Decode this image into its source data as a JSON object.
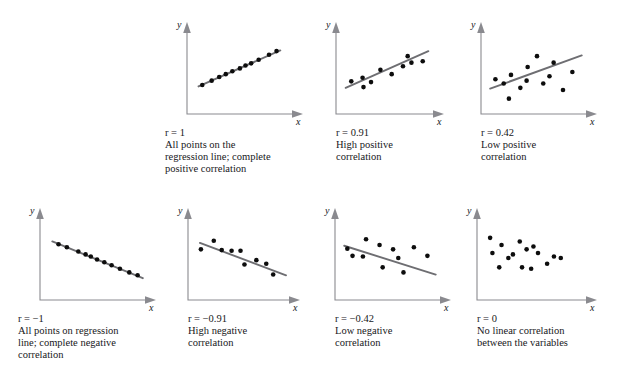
{
  "figure": {
    "axis_label_x": "x",
    "axis_label_y": "y",
    "line_color": "#6e6e72",
    "axis_color": "#8a8a8f",
    "point_color": "#0d0d0d",
    "background": "#ffffff"
  },
  "chart_data": {
    "type": "scatter",
    "xlabel": "x",
    "ylabel": "y",
    "grid": false,
    "legend": "none",
    "axis_ranges": {
      "xlim": [
        0,
        100
      ],
      "ylim": [
        0,
        100
      ]
    },
    "panels": [
      {
        "id": "r-1",
        "row": 1,
        "col": 1,
        "r_value": "r = 1",
        "r_numeric": 1,
        "caption": "All points on the\nregression line; complete\npositive correlation",
        "has_regression_line": true,
        "regression_line": {
          "x1": 8,
          "y1": 30,
          "x2": 95,
          "y2": 80
        },
        "x": [
          12,
          22,
          30,
          37,
          44,
          52,
          58,
          64,
          72,
          83,
          91
        ],
        "y": [
          32,
          38,
          43,
          47,
          51,
          55,
          59,
          62,
          67,
          74,
          79
        ]
      },
      {
        "id": "r-0-91",
        "row": 1,
        "col": 2,
        "r_value": "r = 0.91",
        "r_numeric": 0.91,
        "caption": "High positive\ncorrelation",
        "has_regression_line": true,
        "regression_line": {
          "x1": 6,
          "y1": 28,
          "x2": 94,
          "y2": 79
        },
        "x": [
          12,
          24,
          25,
          33,
          43,
          55,
          67,
          72,
          76,
          88
        ],
        "y": [
          37,
          42,
          29,
          36,
          53,
          47,
          58,
          72,
          63,
          65
        ]
      },
      {
        "id": "r-0-42",
        "row": 1,
        "col": 3,
        "r_value": "r = 0.42",
        "r_numeric": 0.42,
        "caption": "Low positive\ncorrelation",
        "has_regression_line": true,
        "regression_line": {
          "x1": 5,
          "y1": 27,
          "x2": 93,
          "y2": 73
        },
        "x": [
          10,
          18,
          23,
          25,
          34,
          40,
          41,
          50,
          56,
          62,
          66,
          75,
          84
        ],
        "y": [
          40,
          34,
          13,
          46,
          28,
          38,
          57,
          72,
          34,
          44,
          63,
          25,
          50
        ]
      },
      {
        "id": "r-neg-1",
        "row": 2,
        "col": 1,
        "r_value": "r = −1",
        "r_numeric": -1,
        "caption": "All points on regression\nline;  complete negative\ncorrelation",
        "has_regression_line": true,
        "regression_line": {
          "x1": 8,
          "y1": 73,
          "x2": 95,
          "y2": 22
        },
        "x": [
          14,
          22,
          33,
          40,
          45,
          51,
          58,
          65,
          73,
          82,
          90
        ],
        "y": [
          69,
          65,
          59,
          55,
          52,
          48,
          44,
          40,
          35,
          30,
          26
        ]
      },
      {
        "id": "r-neg-0-91",
        "row": 2,
        "col": 2,
        "r_value": "r = −0.91",
        "r_numeric": -0.91,
        "caption": "High negative\ncorrelation",
        "has_regression_line": true,
        "regression_line": {
          "x1": 8,
          "y1": 71,
          "x2": 95,
          "y2": 26
        },
        "x": [
          9,
          22,
          30,
          40,
          49,
          53,
          65,
          75,
          82
        ],
        "y": [
          62,
          74,
          61,
          60,
          60,
          41,
          47,
          42,
          27
        ]
      },
      {
        "id": "r-neg-0-42",
        "row": 2,
        "col": 3,
        "r_value": "r = −0.42",
        "r_numeric": -0.42,
        "caption": "Low negative\ncorrelation",
        "has_regression_line": true,
        "regression_line": {
          "x1": 5,
          "y1": 67,
          "x2": 93,
          "y2": 27
        },
        "x": [
          8,
          13,
          23,
          26,
          39,
          42,
          52,
          57,
          62,
          72,
          85
        ],
        "y": [
          63,
          53,
          52,
          76,
          68,
          37,
          62,
          50,
          30,
          65,
          53
        ]
      },
      {
        "id": "r-0",
        "row": 2,
        "col": 4,
        "r_value": "r = 0",
        "r_numeric": 0,
        "caption": "No linear correlation\nbetween the variables",
        "has_regression_line": false,
        "regression_line": null,
        "x": [
          8,
          18,
          10,
          24,
          16,
          34,
          28,
          40,
          46,
          36,
          50,
          44,
          58,
          64,
          70
        ],
        "y": [
          78,
          68,
          57,
          50,
          37,
          73,
          55,
          62,
          66,
          37,
          57,
          35,
          42,
          52,
          50
        ]
      }
    ]
  }
}
